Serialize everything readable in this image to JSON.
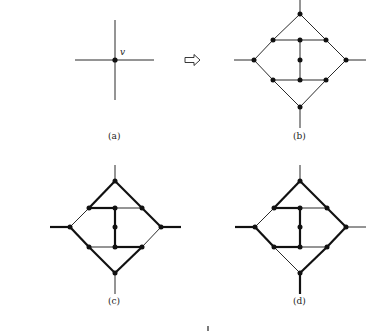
{
  "figure": {
    "panels": [
      {
        "id": "a",
        "caption": "(a)",
        "vertex_label": "v",
        "description": "single vertex v of degree 4"
      },
      {
        "id": "b",
        "caption": "(b)",
        "description": "vertex replaced by gadget with 11 nodes"
      },
      {
        "id": "c",
        "caption": "(c)",
        "description": "gadget with highlighted path through left and right stubs"
      },
      {
        "id": "d",
        "caption": "(d)",
        "description": "gadget with highlighted path through left and bottom stubs"
      }
    ],
    "arrow": "⇨",
    "colors": {
      "line": "#111111",
      "background": "#ffffff"
    }
  }
}
